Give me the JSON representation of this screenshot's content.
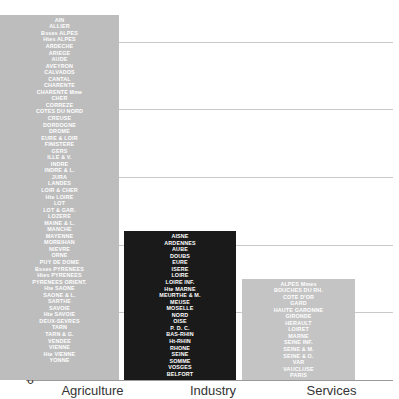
{
  "chart_data": {
    "type": "bar",
    "title": "",
    "xlabel": "",
    "ylabel": "",
    "ylim": [
      0,
      55
    ],
    "grid": true,
    "legend": "none",
    "categories": [
      "Agriculture",
      "Industry",
      "Services"
    ],
    "values": [
      54,
      22,
      15
    ],
    "yticks": [
      0,
      10,
      20,
      30,
      40,
      50
    ],
    "ytick_labels": [
      "0",
      "10",
      "20",
      "30",
      "40",
      "50"
    ],
    "colors": {
      "agriculture": "#bdbdbd",
      "industry": "#1a1a1a",
      "services": "#c4c4c4",
      "label_text": "#ffffff",
      "axis_text": "#2b2b2b",
      "gridline": "#c9c9c9"
    },
    "point_labels": {
      "agriculture": [
        "AIN",
        "ALLIER",
        "Bsses ALPES",
        "Htes ALPES",
        "ARDECHE",
        "ARIEGE",
        "AUDE",
        "AVEYRON",
        "CALVADOS",
        "CANTAL",
        "CHARENTE",
        "CHARENTE Mme",
        "CHER",
        "CORREZE",
        "COTES DU NORD",
        "CREUSE",
        "DORDOGNE",
        "DROME",
        "EURE & LOIR",
        "FINISTERE",
        "GERS",
        "ILLE & V.",
        "INDRE",
        "INDRE & L.",
        "JURA",
        "LANDES",
        "LOIR & CHER",
        "Hte LOIRE",
        "LOT",
        "LOT & GAR.",
        "LOZERE",
        "MAINE & L.",
        "MANCHE",
        "MAYENNE",
        "MORBIHAN",
        "NIEVRE",
        "ORNE",
        "PUY DE DOME",
        "Bsses PYRENEES",
        "Htes PYRENEES",
        "PYRENEES ORIENT.",
        "Hte SAONE",
        "SAONE & L.",
        "SARTHE",
        "SAVOIE",
        "Hte SAVOIE",
        "DEUX-SEVRES",
        "TARN",
        "TARN & G.",
        "VENDEE",
        "VIENNE",
        "Hte VIENNE",
        "YONNE"
      ],
      "industry": [
        "AISNE",
        "ARDENNES",
        "AUBE",
        "DOUBS",
        "EURE",
        "ISERE",
        "LOIRE",
        "LOIRE INF.",
        "Hte MARNE",
        "MEURTHE & M.",
        "MEUSE",
        "MOSELLE",
        "NORD",
        "OISE",
        "P. D. C.",
        "BAS-RHIN",
        "Ht-RHIN",
        "RHONE",
        "SEINE",
        "SOMME",
        "VOSGES",
        "BELFORT"
      ],
      "services": [
        "ALPES Mmes",
        "BOUCHES DU RH.",
        "COTE D'OR",
        "GARD",
        "HAUTE GARONNE",
        "GIRONDE",
        "HERAULT",
        "LOIRET",
        "MARNE",
        "SEINE INF.",
        "SEINE & M.",
        "SEINE & O.",
        "VAR",
        "VAUCLUSE",
        "PARIS"
      ]
    }
  }
}
